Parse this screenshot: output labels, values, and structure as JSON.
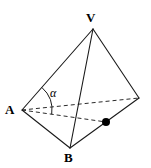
{
  "figure": {
    "kind": "geometry-diagram",
    "background_color": "#ffffff",
    "stroke_color": "#1a1a1a",
    "dash_color": "#2b2b2b",
    "marker_color": "#000000",
    "labels": {
      "apex": "V",
      "left": "A",
      "bottom": "B",
      "angle": "α"
    },
    "vertices": {
      "V": {
        "x": 93,
        "y": 29
      },
      "A": {
        "x": 22,
        "y": 110
      },
      "B": {
        "x": 70,
        "y": 148
      },
      "C": {
        "x": 139,
        "y": 98
      },
      "M": {
        "x": 106,
        "y": 122
      }
    },
    "solid_edges": [
      {
        "name": "edge-V-A",
        "from": "V",
        "to": "A"
      },
      {
        "name": "edge-V-B",
        "from": "V",
        "to": "B"
      },
      {
        "name": "edge-V-C",
        "from": "V",
        "to": "C"
      },
      {
        "name": "edge-A-B",
        "from": "A",
        "to": "B"
      },
      {
        "name": "edge-B-C",
        "from": "B",
        "to": "C"
      }
    ],
    "dashed_edges": [
      {
        "name": "edge-A-C",
        "from": "A",
        "to": "C"
      },
      {
        "name": "median-A-M",
        "from": "A",
        "to": "M"
      }
    ],
    "markers": [
      {
        "name": "midpoint-marker",
        "at": "M",
        "radius": 4
      }
    ],
    "angle_arc": {
      "name": "angle-alpha-arc",
      "vertex": "A",
      "radius": 30,
      "between": [
        "edge-A-V",
        "median-A-M"
      ]
    }
  }
}
